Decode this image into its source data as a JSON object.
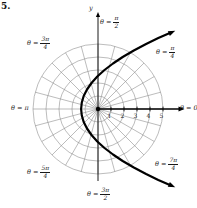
{
  "figure": {
    "exercise_number": "5.",
    "y_axis_label": "y"
  },
  "angle_labels": {
    "zero": "θ = 0",
    "pi": "θ = π",
    "pi_over_2": {
      "pre": "θ =",
      "num": "π",
      "den": "2"
    },
    "pi_over_4": {
      "pre": "θ =",
      "num": "π",
      "den": "4"
    },
    "three_pi_over_4": {
      "pre": "θ =",
      "num": "3π",
      "den": "4"
    },
    "five_pi_over_4": {
      "pre": "θ =",
      "num": "5π",
      "den": "4"
    },
    "three_pi_over_2": {
      "pre": "θ =",
      "num": "3π",
      "den": "2"
    },
    "seven_pi_over_4": {
      "pre": "θ =",
      "num": "7π",
      "den": "4"
    }
  },
  "chart_data": {
    "type": "line",
    "coordinate_system": "polar",
    "title": "",
    "r_axis_ticks": [
      1,
      2,
      3,
      4,
      5
    ],
    "r_max_gridline": 5,
    "theta_gridline_step_deg": 15,
    "theta_ray_labels": [
      "θ = 0",
      "θ = π/4",
      "θ = π/2",
      "θ = 3π/4",
      "θ = π",
      "θ = 5π/4",
      "θ = 3π/2",
      "θ = 7π/4"
    ],
    "grid_color": "#8f8f8f",
    "curve_color": "#000000",
    "curve_note": "Bold conic curve opening to the right; vertex near r = 1.3 at θ = π, crossing θ = π/2 near r = 2.6, ends with arrows heading out between θ = π/4 and θ = 7π/4 directions",
    "curve_points_xy": [
      [
        5.66,
        5.9
      ],
      [
        4.64,
        5.45
      ],
      [
        3.7,
        5.0
      ],
      [
        2.75,
        4.5
      ],
      [
        1.9,
        4.0
      ],
      [
        1.15,
        3.5
      ],
      [
        0.5,
        3.0
      ],
      [
        -0.05,
        2.5
      ],
      [
        -0.5,
        2.0
      ],
      [
        -0.85,
        1.5
      ],
      [
        -1.1,
        1.0
      ],
      [
        -1.25,
        0.5
      ],
      [
        -1.3,
        0.0
      ],
      [
        -1.25,
        -0.5
      ],
      [
        -1.1,
        -1.0
      ],
      [
        -0.85,
        -1.5
      ],
      [
        -0.5,
        -2.0
      ],
      [
        -0.05,
        -2.5
      ],
      [
        0.5,
        -3.0
      ],
      [
        1.15,
        -3.5
      ],
      [
        1.9,
        -4.0
      ],
      [
        2.75,
        -4.5
      ],
      [
        3.7,
        -5.0
      ],
      [
        4.64,
        -5.45
      ],
      [
        5.66,
        -5.9
      ]
    ]
  }
}
